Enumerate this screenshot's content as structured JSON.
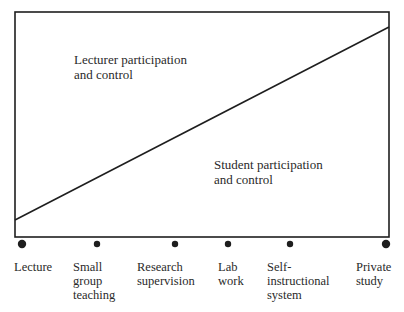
{
  "diagram": {
    "regions": [
      {
        "label": "Lecturer participation\nand control",
        "x": 74,
        "y": 52
      },
      {
        "label": "Student participation\nand control",
        "x": 214,
        "y": 157
      }
    ],
    "axis_points": [
      {
        "label": "Lecture",
        "dot_x": 22,
        "dot_r": 4.2,
        "label_x": 14
      },
      {
        "label": "Small\ngroup\nteaching",
        "dot_x": 97,
        "dot_r": 3.2,
        "label_x": 73
      },
      {
        "label": "Research\nsupervision",
        "dot_x": 175,
        "dot_r": 3.2,
        "label_x": 137
      },
      {
        "label": "Lab\nwork",
        "dot_x": 228,
        "dot_r": 3.2,
        "label_x": 218
      },
      {
        "label": "Self-\ninstructional\nsystem",
        "dot_x": 290,
        "dot_r": 3.2,
        "label_x": 267
      },
      {
        "label": "Private\nstudy",
        "dot_x": 386,
        "dot_r": 4.2,
        "label_x": 356
      }
    ],
    "line": {
      "x1": 15,
      "y1": 220,
      "x2": 389,
      "y2": 27
    },
    "box": {
      "x": 15,
      "y": 12,
      "w": 374,
      "h": 225
    },
    "stroke_color": "#1e1e1e"
  }
}
